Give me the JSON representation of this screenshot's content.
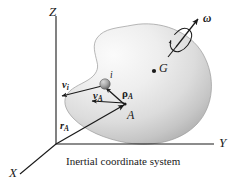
{
  "figure": {
    "caption": "Inertial coordinate system",
    "background_color": "#ffffff",
    "ink_color": "#1a1a1a",
    "body_fill_light": "#f2f2f2",
    "body_fill_dark": "#b9b9b9",
    "axes": [
      {
        "name": "z-axis",
        "label": "Z"
      },
      {
        "name": "y-axis",
        "label": "Y"
      },
      {
        "name": "x-axis",
        "label": "X"
      }
    ],
    "points": [
      {
        "name": "point-a",
        "label": "A"
      },
      {
        "name": "point-g",
        "label": "G"
      },
      {
        "name": "particle-i",
        "label": "i"
      }
    ],
    "vectors": [
      {
        "name": "velocity-i",
        "symbol": "v",
        "subscript": "i"
      },
      {
        "name": "velocity-a",
        "symbol": "v",
        "subscript": "A"
      },
      {
        "name": "rho-a",
        "symbol": "ρ",
        "subscript": "A"
      },
      {
        "name": "r-a",
        "symbol": "r",
        "subscript": "A"
      },
      {
        "name": "angular-velocity",
        "symbol": "ω",
        "subscript": ""
      }
    ],
    "labels": {
      "z": "Z",
      "y": "Y",
      "x": "X",
      "a": "A",
      "g": "G",
      "i": "i",
      "v_sym": "v",
      "v_i_sub": "i",
      "v_a_sub": "A",
      "rho_sym": "ρ",
      "rho_a_sub": "A",
      "r_sym": "r",
      "r_a_sub": "A",
      "omega": "ω"
    }
  }
}
